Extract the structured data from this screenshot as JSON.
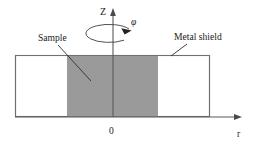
{
  "figure": {
    "background_color": "#ffffff",
    "labels": {
      "sample": "Sample",
      "metal_shield": "Metal shield",
      "axis_z": "Z",
      "axis_r": "r",
      "origin": "0",
      "rotation_angle": "φ"
    },
    "colors": {
      "sample_fill": "#9a9a9a",
      "shield_fill": "#ffffff",
      "shield_stroke": "#707070",
      "axis_stroke": "#5a5a5a",
      "leader_stroke": "#2e2e2e",
      "text": "#1a1a1a"
    },
    "geometry": {
      "shield_rect": {
        "x": 15,
        "y": 55,
        "width": 195,
        "height": 62
      },
      "sample_rect": {
        "x": 67,
        "y": 55,
        "width": 91,
        "height": 62
      },
      "z_axis": {
        "x": 113,
        "y_top": 10,
        "y_bottom": 117
      },
      "r_axis": {
        "y": 117,
        "x_left": 15,
        "x_right": 241
      },
      "phi_ellipse": {
        "cx": 111,
        "cy": 33,
        "rx": 23,
        "ry": 9
      }
    },
    "label_positions": {
      "sample": {
        "x": 38,
        "y": 41
      },
      "metal_shield": {
        "x": 174,
        "y": 40
      },
      "axis_z": {
        "x": 100,
        "y": 15
      },
      "axis_r": {
        "x": 237,
        "y": 137
      },
      "origin": {
        "x": 109,
        "y": 134
      },
      "rotation_angle": {
        "x": 131,
        "y": 25
      }
    },
    "leader_lines": {
      "sample": {
        "x1": 58,
        "y1": 45,
        "x2": 91,
        "y2": 81
      },
      "metal_shield": {
        "x1": 187,
        "y1": 44,
        "x2": 171,
        "y2": 56
      }
    }
  }
}
